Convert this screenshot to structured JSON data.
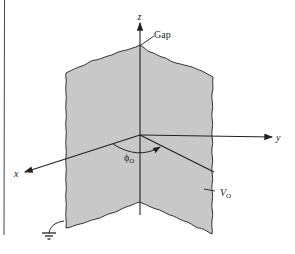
{
  "diagram": {
    "type": "wedge-conductor-geometry",
    "axes": {
      "x_label": "x",
      "y_label": "y",
      "z_label": "z"
    },
    "labels": {
      "gap": "Gap",
      "angle_symbol": "ϕ",
      "angle_subscript": "O",
      "voltage_symbol": "V",
      "voltage_subscript": "O"
    },
    "colors": {
      "plate_fill": "#c8c8c8",
      "line": "#222222",
      "background": "#ffffff"
    },
    "elements": [
      "grounded plate (ϕ = 0)",
      "plate at potential Vo (ϕ = ϕo)",
      "insulating gap along z-axis",
      "ground symbol"
    ]
  }
}
